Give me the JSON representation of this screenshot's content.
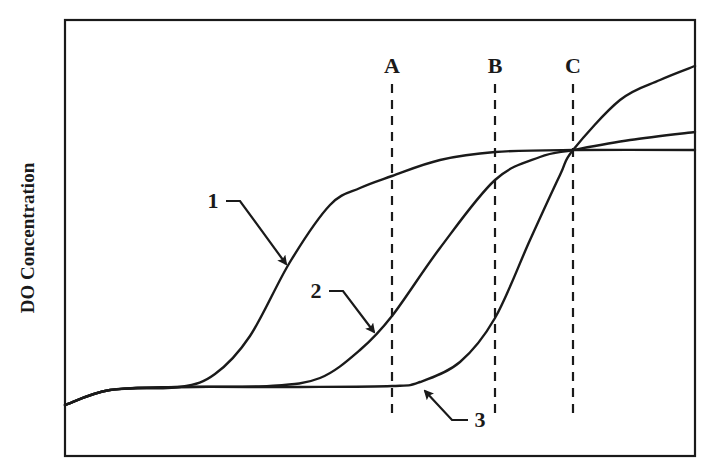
{
  "chart_data": {
    "type": "line",
    "title": "",
    "xlabel": "",
    "ylabel": "DO Concentration",
    "grid": false,
    "legend": "none (curves labelled inline with arrows)",
    "axis_ticks": "none",
    "frame": {
      "left": 65,
      "top": 20,
      "right": 695,
      "bottom": 456
    },
    "reference_lines": [
      {
        "label": "A",
        "x": 392,
        "style": "dashed"
      },
      {
        "label": "B",
        "x": 495,
        "style": "dashed"
      },
      {
        "label": "C",
        "x": 573,
        "style": "dashed"
      }
    ],
    "series": [
      {
        "name": "1",
        "description": "Early sigmoid rise, plateaus near top-middle",
        "points": [
          [
            65,
            405
          ],
          [
            110,
            390
          ],
          [
            180,
            387
          ],
          [
            215,
            374
          ],
          [
            250,
            336
          ],
          [
            290,
            262
          ],
          [
            330,
            205
          ],
          [
            360,
            188
          ],
          [
            392,
            176
          ],
          [
            440,
            160
          ],
          [
            495,
            152
          ],
          [
            573,
            150
          ],
          [
            695,
            150
          ]
        ]
      },
      {
        "name": "2",
        "description": "Later sigmoid rise, converges at C then rises slowly",
        "points": [
          [
            65,
            405
          ],
          [
            110,
            390
          ],
          [
            180,
            387
          ],
          [
            270,
            386
          ],
          [
            320,
            378
          ],
          [
            360,
            350
          ],
          [
            392,
            316
          ],
          [
            440,
            248
          ],
          [
            495,
            180
          ],
          [
            540,
            157
          ],
          [
            573,
            150
          ],
          [
            630,
            140
          ],
          [
            695,
            132
          ]
        ]
      },
      {
        "name": "3",
        "description": "Latest and steepest rise, crosses at C, ends highest",
        "points": [
          [
            65,
            405
          ],
          [
            110,
            390
          ],
          [
            180,
            387
          ],
          [
            300,
            387
          ],
          [
            392,
            386
          ],
          [
            420,
            382
          ],
          [
            460,
            362
          ],
          [
            495,
            318
          ],
          [
            530,
            240
          ],
          [
            560,
            175
          ],
          [
            573,
            150
          ],
          [
            620,
            100
          ],
          [
            660,
            80
          ],
          [
            695,
            66
          ]
        ]
      }
    ],
    "annotations": [
      {
        "text": "1",
        "x": 213,
        "y": 208,
        "arrow_to": [
          286,
          264
        ]
      },
      {
        "text": "2",
        "x": 316,
        "y": 298,
        "arrow_to": [
          374,
          332
        ]
      },
      {
        "text": "3",
        "x": 480,
        "y": 427,
        "arrow_to": [
          425,
          391
        ]
      }
    ]
  },
  "labels": {
    "ylabel": "DO Concentration",
    "ref_A": "A",
    "ref_B": "B",
    "ref_C": "C",
    "curve_1": "1",
    "curve_2": "2",
    "curve_3": "3"
  },
  "colors": {
    "ink": "#1a1a1a",
    "background": "#ffffff"
  }
}
